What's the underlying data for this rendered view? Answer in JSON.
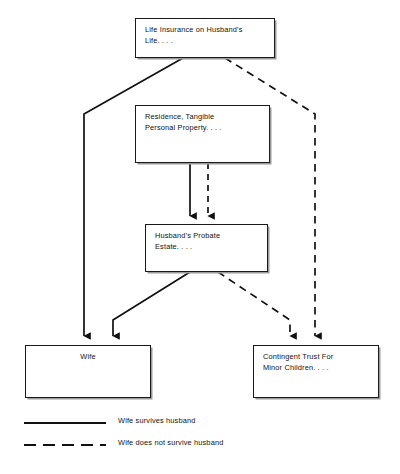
{
  "diagram": {
    "nodes": [
      {
        "id": "life-insurance",
        "label": "Life Insurance on Husband's\nLife. . . ."
      },
      {
        "id": "residence",
        "label": "Residence, Tangible\nPersonal Property. . . ."
      },
      {
        "id": "probate-estate",
        "label": "Husband's Probate\nEstate. . . ."
      },
      {
        "id": "wife",
        "label": "Wife"
      },
      {
        "id": "contingent-trust",
        "label": "Contingent Trust For\nMinor Children. . . ."
      }
    ],
    "edges": [
      {
        "id": "insurance-to-wife",
        "style": "solid",
        "from": "life-insurance",
        "to": "wife"
      },
      {
        "id": "insurance-to-trust",
        "style": "dashed",
        "from": "life-insurance",
        "to": "contingent-trust"
      },
      {
        "id": "residence-to-probate-solid",
        "style": "solid",
        "from": "residence",
        "to": "probate-estate"
      },
      {
        "id": "residence-to-probate-dashed",
        "style": "dashed",
        "from": "residence",
        "to": "probate-estate"
      },
      {
        "id": "probate-to-wife",
        "style": "solid",
        "from": "probate-estate",
        "to": "wife"
      },
      {
        "id": "probate-to-trust",
        "style": "dashed",
        "from": "probate-estate",
        "to": "contingent-trust"
      }
    ],
    "legend": [
      {
        "id": "solid",
        "style": "solid",
        "label": "Wife survives husband"
      },
      {
        "id": "dashed",
        "style": "dashed",
        "label": "Wife does not survive husband"
      }
    ],
    "colors": {
      "line": "#111111",
      "box_border": "#1a1a1a",
      "background": "#ffffff",
      "shadow": "#9a9a9a"
    }
  }
}
